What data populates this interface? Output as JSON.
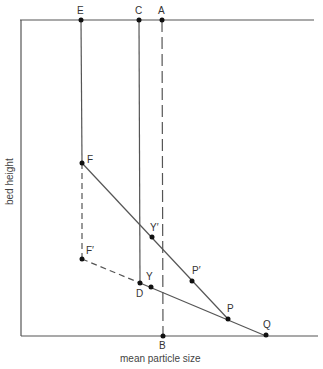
{
  "diagram": {
    "x_axis_label": "mean particle size",
    "y_axis_label": "bed height",
    "points": {
      "E": {
        "label": "E",
        "x": 81,
        "y": 20
      },
      "C": {
        "label": "C",
        "x": 139,
        "y": 20
      },
      "A": {
        "label": "A",
        "x": 162,
        "y": 20
      },
      "F": {
        "label": "F",
        "x": 82,
        "y": 163
      },
      "F_prime": {
        "label": "F′",
        "x": 82,
        "y": 259
      },
      "Y_prime": {
        "label": "Y′",
        "x": 152,
        "y": 237
      },
      "P_prime": {
        "label": "P′",
        "x": 192,
        "y": 281
      },
      "D": {
        "label": "D",
        "x": 140,
        "y": 283
      },
      "Y": {
        "label": "Y",
        "x": 151,
        "y": 287
      },
      "P": {
        "label": "P",
        "x": 228,
        "y": 319
      },
      "Q": {
        "label": "Q",
        "x": 266,
        "y": 335
      },
      "B": {
        "label": "B",
        "x": 163,
        "y": 336
      }
    },
    "colors": {
      "line": "#555555",
      "point": "#111111"
    }
  }
}
